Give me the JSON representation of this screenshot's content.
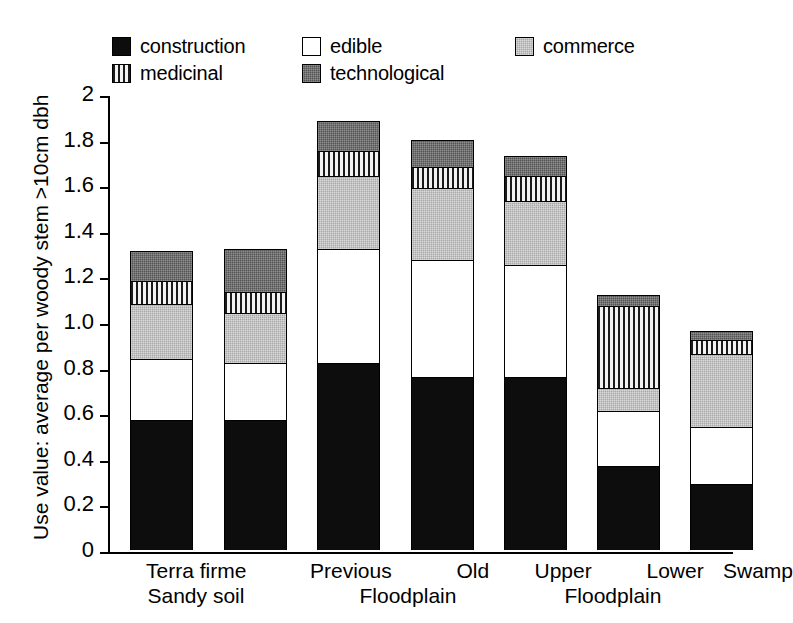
{
  "chart_data": {
    "type": "bar",
    "subtype": "stacked-bar",
    "title": "",
    "xlabel": "",
    "ylabel": "Use value: average per woody stem >10cm dbh",
    "ylim": [
      0,
      2
    ],
    "ytick_labels": [
      "0",
      "0.2",
      "0.4",
      "0.6",
      "0.8",
      "1.0",
      "1.2",
      "1.4",
      "1.6",
      "1.8",
      "2"
    ],
    "ytick_values": [
      0,
      0.2,
      0.4,
      0.6,
      0.8,
      1.0,
      1.2,
      1.4,
      1.6,
      1.8,
      2
    ],
    "grid": false,
    "legend_position": "top",
    "categories": [
      "Terra firme Sandy soil",
      "Terra firme Sandy soil",
      "Previous Floodplain",
      "Old Floodplain",
      "Upper Floodplain",
      "Lower Floodplain",
      "Swamp"
    ],
    "category_labels": [
      {
        "line1": "Terra firme",
        "line2": "Sandy soil"
      },
      {
        "line1": "",
        "line2": ""
      },
      {
        "line1": "Previous",
        "line2": ""
      },
      {
        "line1": "Old",
        "line2": "Floodplain"
      },
      {
        "line1": "Upper",
        "line2": ""
      },
      {
        "line1": "Lower",
        "line2": "Floodplain"
      },
      {
        "line1": "Swamp",
        "line2": ""
      }
    ],
    "series": [
      {
        "name": "construction",
        "color": "#0d0d0d",
        "pattern": "solid",
        "values": [
          0.57,
          0.57,
          0.82,
          0.76,
          0.76,
          0.37,
          0.29
        ]
      },
      {
        "name": "edible",
        "color": "#ffffff",
        "pattern": "empty",
        "values": [
          0.27,
          0.25,
          0.5,
          0.51,
          0.49,
          0.24,
          0.25
        ]
      },
      {
        "name": "commerce",
        "color": "#a8a8a8",
        "pattern": "fine-stipple",
        "values": [
          0.24,
          0.22,
          0.32,
          0.32,
          0.28,
          0.1,
          0.32
        ]
      },
      {
        "name": "medicinal",
        "color": "#e9e9e9",
        "pattern": "vertical-lines",
        "values": [
          0.1,
          0.09,
          0.11,
          0.09,
          0.11,
          0.36,
          0.06
        ]
      },
      {
        "name": "technological",
        "color": "#545454",
        "pattern": "dark-stipple",
        "values": [
          0.13,
          0.19,
          0.13,
          0.12,
          0.09,
          0.05,
          0.04
        ]
      }
    ],
    "totals": [
      1.31,
      1.32,
      1.88,
      1.8,
      1.73,
      1.12,
      0.96
    ]
  },
  "legend": {
    "items": [
      {
        "label": "construction",
        "swatch": "construction"
      },
      {
        "label": "medicinal",
        "swatch": "medicinal"
      },
      {
        "label": "edible",
        "swatch": "edible"
      },
      {
        "label": "technological",
        "swatch": "technological"
      },
      {
        "label": "commerce",
        "swatch": "commerce"
      }
    ]
  },
  "axes": {
    "y_title": "Use value: average per woody stem >10cm dbh"
  }
}
